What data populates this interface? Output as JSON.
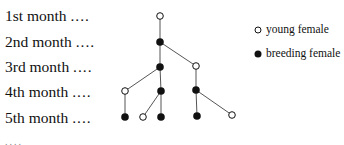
{
  "rows": [
    {
      "label": "1st month",
      "dots": "....",
      "y": 7
    },
    {
      "label": "2nd month",
      "dots": "....",
      "y": 33
    },
    {
      "label": "3rd month",
      "dots": "....",
      "y": 58
    },
    {
      "label": "4th month",
      "dots": "....",
      "y": 83
    },
    {
      "label": "5th month",
      "dots": "....",
      "y": 109
    }
  ],
  "legend": {
    "young": "young female",
    "breeding": "breeding female"
  },
  "trailing_dots": "....",
  "tree": {
    "nodes": [
      {
        "id": "m1",
        "x": 160,
        "y": 16,
        "type": "young"
      },
      {
        "id": "m2",
        "x": 160,
        "y": 42,
        "type": "breeding"
      },
      {
        "id": "m3a",
        "x": 160,
        "y": 67,
        "type": "breeding"
      },
      {
        "id": "m3b",
        "x": 196,
        "y": 66,
        "type": "young"
      },
      {
        "id": "m4a",
        "x": 125,
        "y": 91,
        "type": "young"
      },
      {
        "id": "m4b",
        "x": 161,
        "y": 91,
        "type": "breeding"
      },
      {
        "id": "m4c",
        "x": 196,
        "y": 90,
        "type": "breeding"
      },
      {
        "id": "m5a",
        "x": 125,
        "y": 117,
        "type": "breeding"
      },
      {
        "id": "m5b",
        "x": 143,
        "y": 117,
        "type": "young"
      },
      {
        "id": "m5c",
        "x": 161,
        "y": 117,
        "type": "breeding"
      },
      {
        "id": "m5d",
        "x": 197,
        "y": 116,
        "type": "breeding"
      },
      {
        "id": "m5e",
        "x": 232,
        "y": 115,
        "type": "young"
      }
    ],
    "edges": [
      [
        "m1",
        "m2"
      ],
      [
        "m2",
        "m3a"
      ],
      [
        "m2",
        "m3b"
      ],
      [
        "m3a",
        "m4a"
      ],
      [
        "m3a",
        "m4b"
      ],
      [
        "m3b",
        "m4c"
      ],
      [
        "m4a",
        "m5a"
      ],
      [
        "m4b",
        "m5b"
      ],
      [
        "m4b",
        "m5c"
      ],
      [
        "m4c",
        "m5d"
      ],
      [
        "m4c",
        "m5e"
      ]
    ]
  }
}
